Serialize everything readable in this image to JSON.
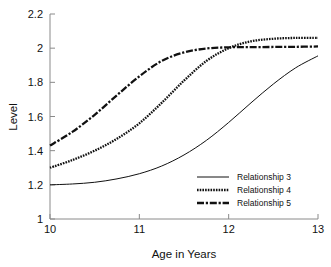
{
  "chart_data": {
    "type": "line",
    "title": "",
    "xlabel": "Age in Years",
    "ylabel": "Level",
    "xlim": [
      10,
      13
    ],
    "ylim": [
      1,
      2.2
    ],
    "xticks": [
      "10",
      "11",
      "12",
      "13"
    ],
    "yticks": [
      "1",
      "1.2",
      "1.4",
      "1.6",
      "1.8",
      "2",
      "2.2"
    ],
    "xtick_values": [
      10,
      11,
      12,
      13
    ],
    "ytick_values": [
      1,
      1.2,
      1.4,
      1.6,
      1.8,
      2,
      2.2
    ],
    "grid": false,
    "legend_position": "lower right",
    "line_color": "#111111",
    "series": [
      {
        "name": "Relationship 3",
        "style": "solid",
        "x": [
          10.0,
          10.25,
          10.5,
          10.75,
          11.0,
          11.25,
          11.5,
          11.75,
          12.0,
          12.25,
          12.5,
          12.75,
          13.0
        ],
        "values": [
          1.2,
          1.205,
          1.215,
          1.235,
          1.265,
          1.31,
          1.375,
          1.46,
          1.565,
          1.68,
          1.79,
          1.885,
          1.955
        ]
      },
      {
        "name": "Relationship 4",
        "style": "dotted",
        "x": [
          10.0,
          10.25,
          10.5,
          10.75,
          11.0,
          11.25,
          11.5,
          11.75,
          12.0,
          12.25,
          12.5,
          12.75,
          13.0
        ],
        "values": [
          1.3,
          1.345,
          1.4,
          1.47,
          1.56,
          1.68,
          1.81,
          1.925,
          2.0,
          2.04,
          2.055,
          2.06,
          2.06
        ]
      },
      {
        "name": "Relationship 5",
        "style": "dashdot",
        "x": [
          10.0,
          10.25,
          10.5,
          10.75,
          11.0,
          11.25,
          11.5,
          11.75,
          12.0,
          12.25,
          12.5,
          12.75,
          13.0
        ],
        "values": [
          1.43,
          1.51,
          1.61,
          1.725,
          1.835,
          1.925,
          1.975,
          1.998,
          2.005,
          2.006,
          2.007,
          2.008,
          2.01
        ]
      }
    ]
  },
  "legend": {
    "entries": [
      {
        "label": "Relationship 3"
      },
      {
        "label": "Relationship 4"
      },
      {
        "label": "Relationship 5"
      }
    ]
  },
  "axes": {
    "y_title": "Level",
    "x_title": "Age in Years"
  }
}
